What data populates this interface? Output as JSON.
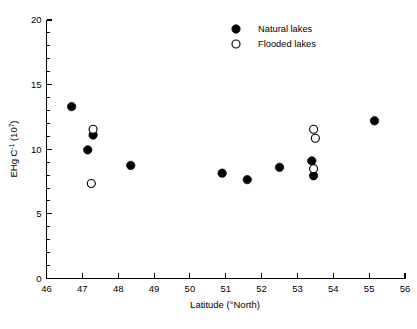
{
  "chart_data": {
    "type": "scatter",
    "title": "",
    "xlabel": "Latitude (°North)",
    "ylabel": "EHg C⁻¹ (10⁷)",
    "ylabel_main": "EHg C",
    "ylabel_sup1": "-1",
    "ylabel_mid": " (10",
    "ylabel_sup2": "7",
    "ylabel_end": ")",
    "xlim": [
      46,
      56
    ],
    "ylim": [
      0,
      20
    ],
    "xticks": [
      46,
      47,
      48,
      49,
      50,
      51,
      52,
      53,
      54,
      55,
      56
    ],
    "xtick_labels": [
      "46",
      "47",
      "48",
      "49",
      "50",
      "51",
      "52",
      "53",
      "54",
      "55",
      "56"
    ],
    "yticks": [
      0,
      5,
      10,
      15,
      20
    ],
    "ytick_labels": [
      "0",
      "5",
      "10",
      "15",
      "20"
    ],
    "y_minor_step": 1,
    "grid": false,
    "legend_position": "top-right",
    "series": [
      {
        "name": "Natural lakes",
        "marker": "filled-circle",
        "color": "#000000",
        "points": [
          {
            "x": 46.7,
            "y": 13.3
          },
          {
            "x": 47.15,
            "y": 9.95
          },
          {
            "x": 47.3,
            "y": 11.1
          },
          {
            "x": 48.35,
            "y": 8.75
          },
          {
            "x": 50.9,
            "y": 8.15
          },
          {
            "x": 51.6,
            "y": 7.65
          },
          {
            "x": 52.5,
            "y": 8.6
          },
          {
            "x": 53.4,
            "y": 9.1
          },
          {
            "x": 53.45,
            "y": 7.95
          },
          {
            "x": 55.15,
            "y": 12.2
          }
        ]
      },
      {
        "name": "Flooded lakes",
        "marker": "open-circle",
        "color": "#ffffff",
        "edge_color": "#000000",
        "points": [
          {
            "x": 47.3,
            "y": 11.55
          },
          {
            "x": 47.25,
            "y": 7.35
          },
          {
            "x": 53.45,
            "y": 11.55
          },
          {
            "x": 53.5,
            "y": 10.85
          },
          {
            "x": 53.45,
            "y": 8.5
          }
        ]
      }
    ],
    "legend": [
      {
        "label": "Natural lakes",
        "marker": "filled-circle"
      },
      {
        "label": "Flooded lakes",
        "marker": "open-circle"
      }
    ]
  }
}
